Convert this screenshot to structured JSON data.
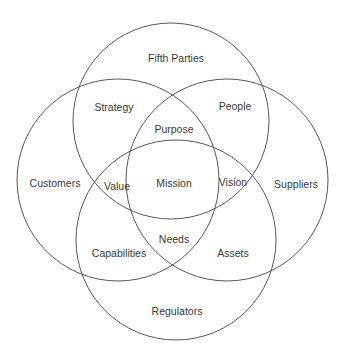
{
  "diagram": {
    "type": "venn",
    "stroke_color": "#444444",
    "circles": [
      {
        "name": "Fifth Parties",
        "cx": 171,
        "cy": 121,
        "r": 98
      },
      {
        "name": "Customers",
        "cx": 118,
        "cy": 180,
        "r": 101
      },
      {
        "name": "Suppliers",
        "cx": 227,
        "cy": 180,
        "r": 101
      },
      {
        "name": "Regulators",
        "cx": 176,
        "cy": 240,
        "r": 100
      }
    ],
    "labels": {
      "fifth_parties": "Fifth Parties",
      "strategy": "Strategy",
      "people": "People",
      "purpose": "Purpose",
      "customers": "Customers",
      "value": "Value",
      "mission": "Mission",
      "vision": "Vision",
      "suppliers": "Suppliers",
      "needs": "Needs",
      "capabilities": "Capabilities",
      "assets": "Assets",
      "regulators": "Regulators"
    }
  }
}
